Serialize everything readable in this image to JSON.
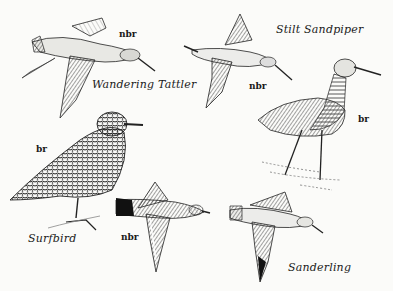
{
  "plate": {
    "description": "Field guide illustration plate of shorebirds",
    "ink_color": "#1a1a1a",
    "paper_color": "#fbfbf9"
  },
  "birds": [
    {
      "species": "Wandering Tattler",
      "plumage": "nbr",
      "pose": "flying"
    },
    {
      "species": "Stilt Sandpiper",
      "plumage_flying": "nbr",
      "plumage_standing": "br",
      "poses": [
        "flying",
        "standing"
      ]
    },
    {
      "species": "Surfbird",
      "plumage_standing": "br",
      "plumage_flying": "nbr",
      "poses": [
        "standing",
        "flying"
      ]
    },
    {
      "species": "Sanderling",
      "pose": "flying"
    }
  ],
  "labels": {
    "wandering_tattler": "Wandering Tattler",
    "wandering_tattler_tag": "nbr",
    "stilt_sandpiper": "Stilt Sandpiper",
    "stilt_sandpiper_flying_tag": "nbr",
    "stilt_sandpiper_standing_tag": "br",
    "surfbird": "Surfbird",
    "surfbird_standing_tag": "br",
    "surfbird_flying_tag": "nbr",
    "sanderling": "Sanderling"
  }
}
